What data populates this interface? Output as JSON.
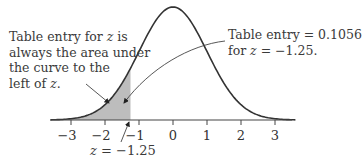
{
  "figure": {
    "left_annotation": {
      "lines": [
        "Table entry for z is",
        "always the area under",
        "the curve to the",
        "left of z."
      ]
    },
    "right_annotation": {
      "lines": [
        "Table entry = 0.1056",
        "for z = −1.25."
      ]
    },
    "bottom_annotation": "z = −1.25",
    "colors": {
      "curve": "#333333",
      "shading": "#bdbdbd",
      "axis": "#444444"
    }
  },
  "chart_data": {
    "type": "area",
    "distribution": "standard normal N(0,1)",
    "x_ticks": [
      -3,
      -2,
      -1,
      0,
      1,
      2,
      3
    ],
    "tick_labels": [
      "−3",
      "−2",
      "−1",
      "0",
      "1",
      "2",
      "3"
    ],
    "shaded_region": {
      "from": "-inf",
      "to": -1.25,
      "area": 0.1056
    },
    "z": -1.25,
    "table_entry": 0.1056,
    "xlabel": "",
    "ylabel": "",
    "grid": false
  }
}
